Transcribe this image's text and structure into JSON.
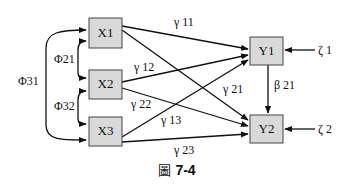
{
  "diagram": {
    "type": "path-diagram",
    "nodes": {
      "x1": {
        "label": "X1"
      },
      "x2": {
        "label": "X2"
      },
      "x3": {
        "label": "X3"
      },
      "y1": {
        "label": "Y1"
      },
      "y2": {
        "label": "Y2"
      }
    },
    "covariances": {
      "phi21": "Φ21",
      "phi32": "Φ32",
      "phi31": "Φ31"
    },
    "paths": {
      "gamma11": "γ 11",
      "gamma12": "γ 12",
      "gamma13": "γ 13",
      "gamma21": "γ 21",
      "gamma22": "γ 22",
      "gamma23": "γ 23",
      "beta21": "β 21"
    },
    "errors": {
      "zeta1": "ζ 1",
      "zeta2": "ζ 2"
    },
    "colors": {
      "box_fill": "#d9d9d9",
      "box_stroke": "#444444",
      "line": "#111111"
    }
  },
  "caption": {
    "glyph": "圖",
    "label": "7-4"
  }
}
